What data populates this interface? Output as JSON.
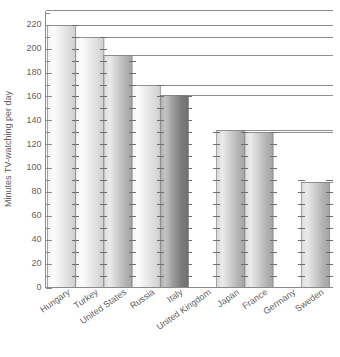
{
  "chart_data": {
    "type": "bar",
    "title": "",
    "subtitle": "",
    "xlabel": "",
    "ylabel": "Minutes TV-watching per day",
    "categories": [
      "Hungary",
      "Turkey",
      "United States",
      "Russia",
      "Italy",
      "United Kingdom",
      "Japan",
      "France",
      "Germany",
      "Sweden"
    ],
    "values": [
      220,
      210,
      195,
      170,
      161,
      null,
      132,
      130,
      null,
      88
    ],
    "ylim": [
      0,
      232
    ],
    "ytick_labels": [
      "0",
      "20",
      "40",
      "60",
      "80",
      "100",
      "120",
      "140",
      "160",
      "180",
      "200",
      "220"
    ],
    "ytick_values": [
      0,
      20,
      40,
      60,
      80,
      100,
      120,
      140,
      160,
      180,
      200,
      220
    ],
    "minor_tick_step": 10,
    "grid": false,
    "legend": null
  },
  "axis": {
    "y_title": "Minutes TV-watching per day"
  },
  "bars": [
    {
      "label": "Hungary",
      "value": 220,
      "shade": "light"
    },
    {
      "label": "Turkey",
      "value": 210,
      "shade": "light"
    },
    {
      "label": "United States",
      "value": 195,
      "shade": "medium"
    },
    {
      "label": "Russia",
      "value": 170,
      "shade": "light"
    },
    {
      "label": "Italy",
      "value": 161,
      "shade": "dark"
    },
    {
      "label": "United Kingdom",
      "value": null,
      "shade": "none"
    },
    {
      "label": "Japan",
      "value": 132,
      "shade": "medium"
    },
    {
      "label": "France",
      "value": 130,
      "shade": "medium"
    },
    {
      "label": "Germany",
      "value": null,
      "shade": "none"
    },
    {
      "label": "Sweden",
      "value": 88,
      "shade": "medium"
    }
  ],
  "colors": {
    "axis": "#8a8a8a",
    "text": "#5f5f5f",
    "leader_line": "#8f8f8f",
    "bar_light": "#ededed",
    "bar_medium": "#c9c9c9",
    "bar_dark": "#9a9a9a",
    "background": "#ffffff"
  }
}
